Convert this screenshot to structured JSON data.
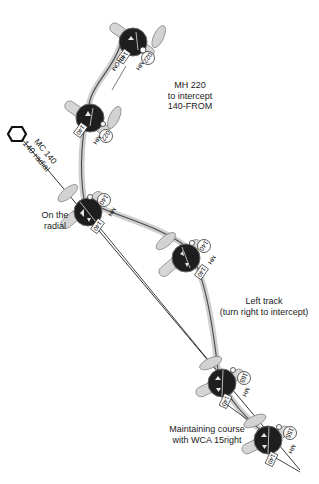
{
  "diagram": {
    "colors": {
      "track": "#c8c8c8",
      "track_core": "#4a4a4a",
      "instrument": "#1e1e1e",
      "aircraft": "#d4d4d4",
      "line": "#333333",
      "background": "#ffffff"
    },
    "station": {
      "icon": "vor-hexagon-icon",
      "label_line1": "MC 140",
      "label_line2": "140 radial"
    },
    "annotations": {
      "intercept": {
        "line1": "MH 220",
        "line2": "to intercept",
        "line3": "140-FROM"
      },
      "on_radial": {
        "line1": "On the",
        "line2": "radial"
      },
      "left_track": {
        "line1": "Left track",
        "line2": "(turn right to intercept)"
      },
      "maintaining": {
        "line1": "Maintaining course",
        "line2": "with WCA 15right"
      }
    },
    "aircraft": [
      {
        "id": "a1",
        "obs": "140",
        "obs_flag": "FROM",
        "heading": "220",
        "heading_label": "MH"
      },
      {
        "id": "a2",
        "obs": "140",
        "heading": "220",
        "heading_label": "MH"
      },
      {
        "id": "a3",
        "obs": "140",
        "heading": "140",
        "heading_label": "MH"
      },
      {
        "id": "a4",
        "obs": "140",
        "heading": "140",
        "heading_label": "MH"
      },
      {
        "id": "a5",
        "obs": "140",
        "heading": "165",
        "heading_label": "MH"
      },
      {
        "id": "a6",
        "obs": "140",
        "heading": "155",
        "heading_label": "MH"
      }
    ]
  }
}
